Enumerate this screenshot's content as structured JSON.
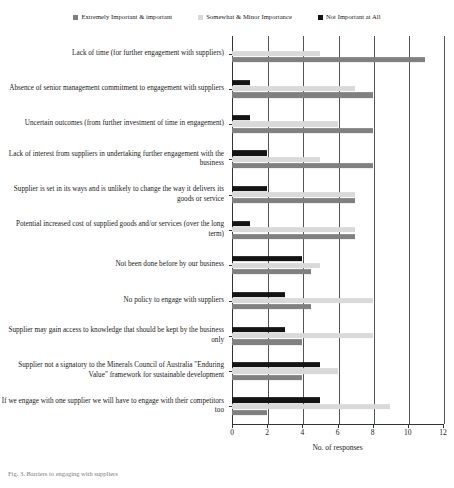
{
  "chart_data": {
    "type": "bar",
    "orientation": "horizontal",
    "title": "",
    "xlabel": "No. of responses",
    "ylabel": "",
    "xlim": [
      0,
      12
    ],
    "xticks": [
      0,
      2,
      4,
      6,
      8,
      10,
      12
    ],
    "xtick_labels": [
      "0",
      "2",
      "4",
      "6",
      "8",
      "10",
      "12"
    ],
    "grid": true,
    "grid_axis": "x",
    "legend_position": "top",
    "categories": [
      "Lack of time (for further engagement with suppliers)",
      "Absence of senior management commitment to engagement with suppliers",
      "Uncertain outcomes (from further investment of time in engagement)",
      "Lack of interest from suppliers in undertaking further engagement with the business",
      "Supplier is set in its ways and is unlikely to change the way it delivers its goods or service",
      "Potential increased cost of supplied goods and/or services (over the long term)",
      "Not been done before by our business",
      "No policy to engage with suppliers",
      "Supplier may gain access to knowledge that should be kept by the business only",
      "Supplier not a signatory to the Minerals Council of Australia \"Enduring Value\" framework for sustainable development",
      "If we engage with one supplier we will have to engage with their competitors too"
    ],
    "series": [
      {
        "name": "Not Important at All",
        "color": "#141414",
        "values": [
          0,
          1,
          1,
          2,
          2,
          1,
          4,
          3,
          3,
          5,
          5
        ]
      },
      {
        "name": "Somewhat & Minor Importance",
        "color": "#d9d9d9",
        "values": [
          5,
          7,
          6,
          5,
          7,
          7,
          5,
          8,
          8,
          6,
          9
        ]
      },
      {
        "name": "Extremely Important & important",
        "color": "#808080",
        "values": [
          11,
          8,
          8,
          8,
          7,
          7,
          4.5,
          4.5,
          4,
          4,
          2
        ]
      }
    ]
  },
  "legend": {
    "items": [
      {
        "label": "Extremely Important & important",
        "color": "#808080"
      },
      {
        "label": "Somewhat & Minor Importance",
        "color": "#d9d9d9"
      },
      {
        "label": "Not Important at All",
        "color": "#141414"
      }
    ]
  },
  "caption": {
    "text": "Fig. 3. Barriers to engaging with suppliers"
  }
}
